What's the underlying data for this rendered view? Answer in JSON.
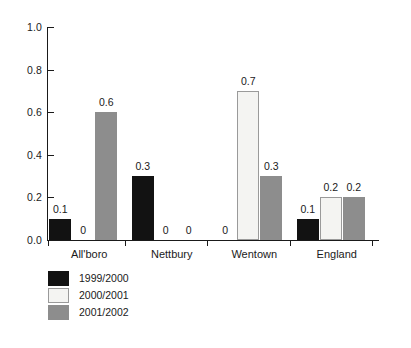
{
  "chart_data": {
    "type": "bar",
    "title": "",
    "subtitle": "",
    "xlabel": "",
    "ylabel": "",
    "categories": [
      "All'boro",
      "Nettbury",
      "Wentown",
      "England"
    ],
    "series": [
      {
        "name": "1999/2000",
        "color": "#121212",
        "values": [
          0.1,
          0.3,
          0,
          0.1
        ],
        "labels": [
          "0.1",
          "0.3",
          "0",
          "0.1"
        ]
      },
      {
        "name": "2000/2001",
        "color": "#f4f4f2",
        "values": [
          0,
          0,
          0.7,
          0.2
        ],
        "labels": [
          "0",
          "0",
          "0.7",
          "0.2"
        ]
      },
      {
        "name": "2001/2002",
        "color": "#8d8d8d",
        "values": [
          0.6,
          0,
          0.3,
          0.2
        ],
        "labels": [
          "0.6",
          "0",
          "0.3",
          "0.2"
        ]
      }
    ],
    "ylim": [
      0.0,
      1.0
    ],
    "yticks": [
      0.0,
      0.2,
      0.4,
      0.6,
      0.8,
      1.0
    ],
    "ytick_labels": [
      "0.0",
      "0.2",
      "0.4",
      "0.6",
      "0.8",
      "1.0"
    ],
    "grid": false,
    "legend_position": "bottom-left",
    "legend_entries": [
      "1999/2000",
      "2000/2001",
      "2001/2002"
    ]
  }
}
